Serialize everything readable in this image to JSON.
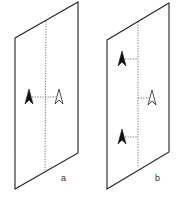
{
  "panels": [
    {
      "label": "a",
      "sheet": {
        "tl": [
          15,
          38
        ],
        "tr": [
          78,
          2
        ],
        "br": [
          78,
          153
        ],
        "bl": [
          15,
          189
        ]
      },
      "axis": {
        "x1": 46,
        "y1": 21,
        "x2": 45,
        "y2": 170
      },
      "filled_arrows": [
        {
          "x": 29,
          "y": 97,
          "tick_to": 45
        }
      ],
      "outline_arrows": [
        {
          "x": 59,
          "y": 97,
          "tick_from": 45
        }
      ],
      "label_pos": [
        61,
        181
      ]
    },
    {
      "label": "b",
      "sheet": {
        "tl": [
          107,
          40
        ],
        "tr": [
          169,
          3
        ],
        "br": [
          169,
          152
        ],
        "bl": [
          107,
          189
        ]
      },
      "axis": {
        "x1": 138,
        "y1": 22,
        "x2": 138,
        "y2": 168
      },
      "filled_arrows": [
        {
          "x": 122,
          "y": 59,
          "tick_to": 138
        },
        {
          "x": 122,
          "y": 137,
          "tick_to": 138
        }
      ],
      "outline_arrows": [
        {
          "x": 152,
          "y": 98,
          "tick_from": 138
        }
      ],
      "label_pos": [
        155,
        181
      ]
    }
  ],
  "colors": {
    "line": "#222222",
    "dotted": "#555555",
    "fill": "#111111"
  }
}
